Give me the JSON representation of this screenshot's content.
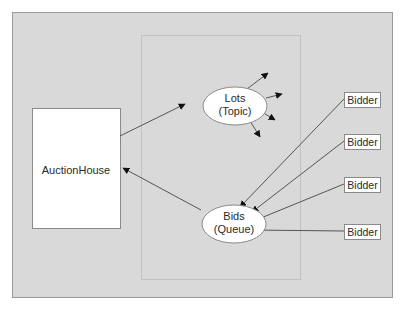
{
  "diagram": {
    "colors": {
      "background": "#d9d9d9",
      "frame_border": "#9a9a9a",
      "box_fill": "#ffffff",
      "line": "#555555",
      "arrowhead": "#111111",
      "dotted": "#a8a8a8"
    },
    "auction_house": {
      "label": "AuctionHouse"
    },
    "lots": {
      "line1": "Lots",
      "line2": "(Topic)"
    },
    "bids": {
      "line1": "Bids",
      "line2": "(Queue)"
    },
    "bidders": [
      {
        "label": "Bidder"
      },
      {
        "label": "Bidder"
      },
      {
        "label": "Bidder"
      },
      {
        "label": "Bidder"
      }
    ]
  }
}
